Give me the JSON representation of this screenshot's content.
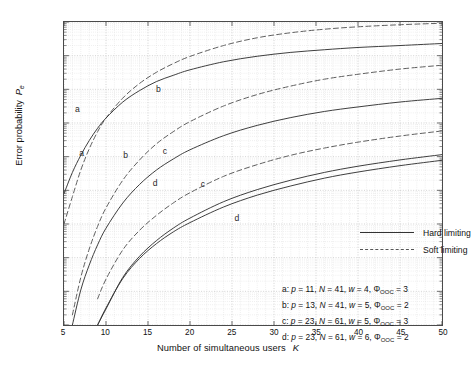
{
  "chart_data": {
    "type": "line",
    "title": "",
    "xlabel": "Number of simultaneous users",
    "xsymbol": "K",
    "ylabel": "Error probability",
    "ysymbol": "P",
    "ysubscript": "e",
    "xlim": [
      5,
      50
    ],
    "ylim": [
      1e-12,
      0.001
    ],
    "yscale": "log",
    "xscale": "linear",
    "grid": true,
    "xticks": [
      5,
      10,
      15,
      20,
      25,
      30,
      35,
      40,
      45,
      50
    ],
    "yticks": [
      "10-3",
      "10-4",
      "10-5",
      "10-6",
      "10-7",
      "10-8",
      "10-9",
      "10-10",
      "10-11",
      "10-12"
    ],
    "yexponents": [
      -3,
      -4,
      -5,
      -6,
      -7,
      -8,
      -9,
      -10,
      -11,
      -12
    ],
    "legend_position": "center-right",
    "series": [
      {
        "name": "a-soft",
        "curve": "a",
        "limiting": "Soft limiting",
        "style": "dashed",
        "x": [
          5,
          6,
          7,
          8,
          9,
          10,
          12,
          14,
          16,
          18,
          20,
          24,
          28,
          32,
          36,
          40,
          45,
          50
        ],
        "y": [
          1e-09,
          6.5e-09,
          4e-08,
          1.7e-07,
          5.5e-07,
          1.4e-06,
          5.5e-06,
          1.5e-05,
          3.2e-05,
          5.8e-05,
          9.5e-05,
          0.0002,
          0.00034,
          0.00048,
          0.00061,
          0.00072,
          0.00083,
          0.00092
        ]
      },
      {
        "name": "a-hard",
        "curve": "a",
        "limiting": "Hard limiting",
        "style": "solid",
        "x": [
          5,
          6,
          7,
          8,
          9,
          10,
          12,
          14,
          16,
          18,
          20,
          24,
          28,
          32,
          36,
          40,
          45,
          50
        ],
        "y": [
          8e-09,
          3.4e-08,
          1.1e-07,
          3e-07,
          7e-07,
          1.4e-06,
          4.2e-06,
          9.2e-06,
          1.7e-05,
          2.6e-05,
          3.8e-05,
          6.6e-05,
          9.6e-05,
          0.000125,
          0.00015,
          0.000175,
          0.0002,
          0.00023
        ]
      },
      {
        "name": "b-soft",
        "curve": "b",
        "limiting": "Soft limiting",
        "style": "dashed",
        "x": [
          6,
          7,
          8,
          9,
          10,
          12,
          14,
          16,
          18,
          20,
          24,
          28,
          32,
          36,
          40,
          45,
          50
        ],
        "y": [
          2e-12,
          2.6e-11,
          1.8e-10,
          8.5e-10,
          3e-09,
          2e-08,
          8e-08,
          2.4e-07,
          5.5e-07,
          1.1e-06,
          3.2e-06,
          7e-06,
          1.25e-05,
          2e-05,
          2.8e-05,
          4e-05,
          5.2e-05
        ]
      },
      {
        "name": "b-hard",
        "curve": "b",
        "limiting": "Hard limiting",
        "style": "solid",
        "x": [
          6,
          7,
          8,
          9,
          10,
          12,
          14,
          16,
          18,
          20,
          24,
          28,
          32,
          36,
          40,
          45,
          50
        ],
        "y": [
          1e-12,
          1.1e-11,
          6e-11,
          2.4e-10,
          7.5e-10,
          4.2e-09,
          1.5e-08,
          4e-08,
          8.5e-08,
          1.6e-07,
          4.2e-07,
          8.5e-07,
          1.45e-06,
          2.2e-06,
          3e-06,
          4.2e-06,
          5.4e-06
        ]
      },
      {
        "name": "c-soft",
        "curve": "c",
        "limiting": "Soft limiting",
        "style": "dashed",
        "x": [
          9,
          10,
          12,
          14,
          16,
          18,
          20,
          24,
          28,
          32,
          36,
          40,
          45,
          50
        ],
        "y": [
          6e-12,
          2.3e-11,
          1.7e-10,
          6.5e-10,
          1.8e-09,
          4.2e-09,
          8.5e-09,
          2.6e-08,
          5.8e-08,
          1.1e-07,
          1.8e-07,
          2.7e-07,
          4.1e-07,
          5.8e-07
        ]
      },
      {
        "name": "c-hard",
        "curve": "c",
        "limiting": "Hard limiting",
        "style": "solid",
        "x": [
          9,
          10,
          12,
          14,
          16,
          18,
          20,
          24,
          28,
          32,
          36,
          40,
          45,
          50
        ],
        "y": [
          1e-12,
          3e-12,
          2.6e-11,
          1.1e-10,
          3.2e-10,
          7.5e-10,
          1.5e-09,
          4.6e-09,
          1.05e-08,
          2e-08,
          3.4e-08,
          5.2e-08,
          8e-08,
          1.15e-07
        ]
      },
      {
        "name": "d-hard",
        "curve": "d",
        "limiting": "Hard limiting",
        "style": "solid",
        "x": [
          9,
          10,
          12,
          14,
          16,
          18,
          20,
          24,
          28,
          32,
          36,
          40,
          45,
          50
        ],
        "y": [
          1e-12,
          3.2e-12,
          2.4e-11,
          9.5e-11,
          2.6e-10,
          5.8e-10,
          1.1e-09,
          3.2e-09,
          7.2e-09,
          1.35e-08,
          2.3e-08,
          3.5e-08,
          5.4e-08,
          7.8e-08
        ]
      }
    ],
    "curve_labels": [
      {
        "text": "a",
        "x": 6.6,
        "y": 2.6e-06
      },
      {
        "text": "a",
        "x": 7.1,
        "y": 1.3e-07
      },
      {
        "text": "b",
        "x": 16.2,
        "y": 1.05e-05
      },
      {
        "text": "b",
        "x": 12.3,
        "y": 1.15e-07
      },
      {
        "text": "c",
        "x": 17.0,
        "y": 1.5e-07
      },
      {
        "text": "c",
        "x": 21.5,
        "y": 1.6e-08
      },
      {
        "text": "d",
        "x": 15.8,
        "y": 1.7e-08
      },
      {
        "text": "d",
        "x": 25.5,
        "y": 1.6e-09
      }
    ],
    "legend": [
      {
        "label": "Hard limiting",
        "style": "solid"
      },
      {
        "label": "Soft limiting",
        "style": "dashed"
      }
    ],
    "annotations": [
      {
        "key": "a",
        "p": "11",
        "N": "41",
        "w": "4",
        "phi": "3"
      },
      {
        "key": "b",
        "p": "13",
        "N": "41",
        "w": "5",
        "phi": "2"
      },
      {
        "key": "c",
        "p": "23",
        "N": "61",
        "w": "5",
        "phi": "3"
      },
      {
        "key": "d",
        "p": "23",
        "N": "61",
        "w": "6",
        "phi": "2"
      }
    ],
    "annotation_symbols": {
      "p": "p",
      "N": "N",
      "w": "w",
      "phi": "Φ",
      "phi_sub": "OOC",
      "eq": " = ",
      "sep": ", ",
      "colon": ": "
    },
    "colors": {
      "solid_curve": "#333333",
      "dashed_curve": "#555555",
      "grid_minor": "#d8d8d8",
      "grid_major": "#bfbfbf",
      "axis": "#4a4a4a",
      "text": "#111111",
      "background": "#ffffff"
    }
  }
}
